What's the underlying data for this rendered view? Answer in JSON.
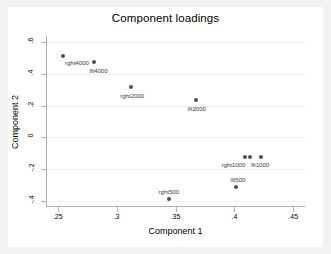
{
  "chart_data": {
    "type": "scatter",
    "title": "Component loadings",
    "xlabel": "Component 1",
    "ylabel": "Component 2",
    "xlim": [
      0.24,
      0.46
    ],
    "ylim": [
      -0.44,
      0.64
    ],
    "xticks": [
      0.25,
      0.3,
      0.35,
      0.4,
      0.45
    ],
    "xticklabels": [
      ".25",
      ".3",
      ".35",
      ".4",
      ".45"
    ],
    "yticks": [
      -0.4,
      -0.2,
      0,
      0.2,
      0.4,
      0.6
    ],
    "yticklabels": [
      "-.4",
      "-.2",
      "0",
      ".2",
      ".4",
      ".6"
    ],
    "grid": "horizontal",
    "legend": "none",
    "marker_color": "#4f4f4f",
    "points": [
      {
        "label": "rght4000",
        "x": 0.2535,
        "y": 0.513,
        "label_dx": 14,
        "label_dy": 6
      },
      {
        "label": "lft4000",
        "x": 0.2795,
        "y": 0.475,
        "label_dx": 5,
        "label_dy": 8
      },
      {
        "label": "rght2000",
        "x": 0.3115,
        "y": 0.318,
        "label_dx": 1,
        "label_dy": 8
      },
      {
        "label": "lft2000",
        "x": 0.3665,
        "y": 0.239,
        "label_dx": 1,
        "label_dy": 8
      },
      {
        "label": "rght1000",
        "x": 0.4085,
        "y": -0.123,
        "label_dx": -12,
        "label_dy": 7
      },
      {
        "label": "lft1000",
        "x": 0.4125,
        "y": -0.123,
        "label_dx": 10,
        "label_dy": 7
      },
      {
        "label": "lft500",
        "x": 0.4005,
        "y": -0.313,
        "label_dx": 2,
        "label_dy": -8
      },
      {
        "label": "rght500",
        "x": 0.3435,
        "y": -0.392,
        "label_dx": 0,
        "label_dy": -8
      }
    ],
    "extra_markers": [
      {
        "x": 0.4215,
        "y": -0.123
      }
    ]
  }
}
